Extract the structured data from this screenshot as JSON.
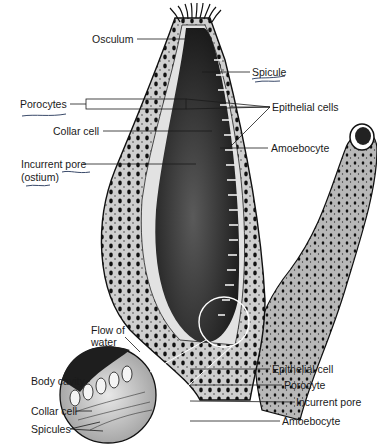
{
  "diagram": {
    "labels_main": {
      "osculum": "Osculum",
      "spicule": "Spicule",
      "porocytes": "Porocytes",
      "epithelial_cells": "Epithelial cells",
      "collar_cell": "Collar cell",
      "amoebocyte": "Amoebocyte",
      "incurrent_pore_line1": "Incurrent pore",
      "incurrent_pore_line2": "(ostium)"
    },
    "labels_inset": {
      "flow_line1": "Flow of",
      "flow_line2": "water",
      "body_cavity": "Body cavity",
      "collar_cell": "Collar cell",
      "spicules": "Spicules",
      "epithelial_cell": "Epithelial cell",
      "porocyte": "Porocyte",
      "incurrent_pore": "Incurrent pore",
      "amoebocyte": "Amoebocyte"
    },
    "colors": {
      "ink": "#1a1a1a",
      "body_fill": "#bdbdbd",
      "cavity_fill": "#2a2a2a",
      "wall_fill": "#d9d9d9",
      "handwritten_underline": "#3a4a6a"
    }
  }
}
